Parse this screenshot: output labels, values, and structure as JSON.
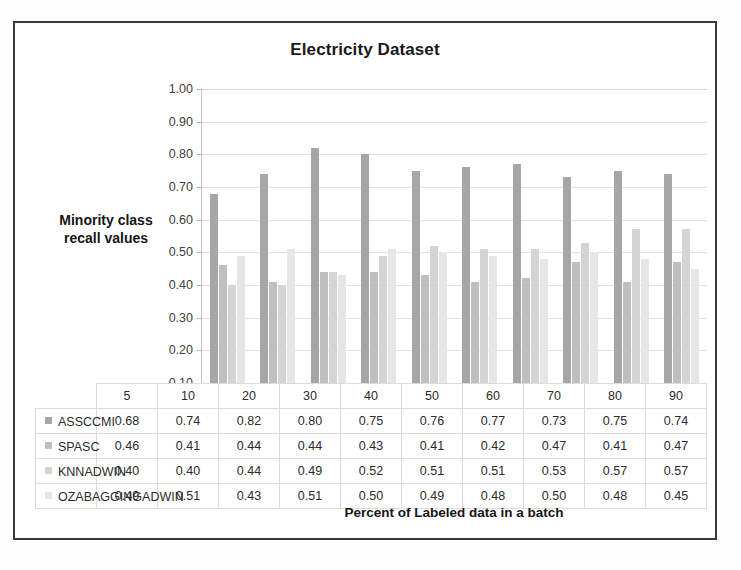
{
  "chart_data": {
    "type": "bar",
    "title": "Electricity Dataset",
    "xlabel": "Percent of Labeled data in a batch",
    "ylabel": "Minority class recall values",
    "ylabel_line1": "Minority  class",
    "ylabel_line2": "recall values",
    "categories": [
      "5",
      "10",
      "20",
      "30",
      "40",
      "50",
      "60",
      "70",
      "80",
      "90"
    ],
    "ylim": [
      0.1,
      1.0
    ],
    "ytick_labels": [
      "1.00",
      "0.90",
      "0.80",
      "0.70",
      "0.60",
      "0.50",
      "0.40",
      "0.30",
      "0.20",
      "0.10"
    ],
    "ytick_values": [
      1.0,
      0.9,
      0.8,
      0.7,
      0.6,
      0.5,
      0.4,
      0.3,
      0.2,
      0.1
    ],
    "grid": true,
    "legend_position": "data-table",
    "series": [
      {
        "name": "ASSCCMI",
        "color": "#a6a6a6",
        "values": [
          0.68,
          0.74,
          0.82,
          0.8,
          0.75,
          0.76,
          0.77,
          0.73,
          0.75,
          0.74
        ]
      },
      {
        "name": "SPASC",
        "color": "#bfbfbf",
        "values": [
          0.46,
          0.41,
          0.44,
          0.44,
          0.43,
          0.41,
          0.42,
          0.47,
          0.41,
          0.47
        ]
      },
      {
        "name": "KNNADWIN",
        "color": "#d4d4d4",
        "values": [
          0.4,
          0.4,
          0.44,
          0.49,
          0.52,
          0.51,
          0.51,
          0.53,
          0.57,
          0.57
        ]
      },
      {
        "name": "OZABAGGINGADWIN",
        "color": "#e6e6e6",
        "values": [
          0.49,
          0.51,
          0.43,
          0.51,
          0.5,
          0.49,
          0.48,
          0.5,
          0.48,
          0.45
        ]
      }
    ]
  }
}
